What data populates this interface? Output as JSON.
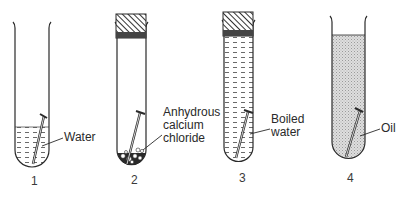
{
  "diagram": {
    "tubes": [
      {
        "number": "1",
        "label": "Water",
        "contents": "water (partially filled)",
        "stopper": false
      },
      {
        "number": "2",
        "label_lines": [
          "Anhydrous",
          "calcium",
          "chloride"
        ],
        "contents": "anhydrous calcium chloride granules",
        "stopper": true
      },
      {
        "number": "3",
        "label_lines": [
          "Boiled",
          "water"
        ],
        "contents": "boiled water (filled)",
        "stopper": true
      },
      {
        "number": "4",
        "label": "Oil",
        "contents": "oil (filled)",
        "stopper": false
      }
    ],
    "colors": {
      "line": "#2a2a2a",
      "oil_fill": "#d4d4d4",
      "stopper_fill": "#555555"
    }
  }
}
